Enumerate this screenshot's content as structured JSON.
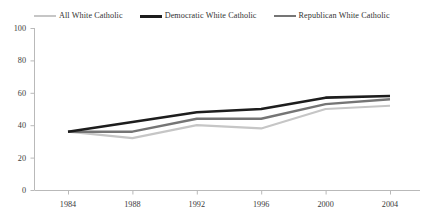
{
  "chart_data": {
    "type": "line",
    "title": "",
    "subtitle": "",
    "xlabel": "",
    "ylabel": "",
    "categories": [
      "1984",
      "1988",
      "1992",
      "1996",
      "2000",
      "2004"
    ],
    "x": [
      1984,
      1988,
      1992,
      1996,
      2000,
      2004
    ],
    "ylim": [
      0,
      100
    ],
    "xlim": [
      1984,
      2004
    ],
    "yticks": [
      "0",
      "20",
      "40",
      "60",
      "80",
      "100"
    ],
    "ytick_values": [
      0,
      20,
      40,
      60,
      80,
      100
    ],
    "grid": false,
    "legend_position": "top",
    "series": [
      {
        "name": "All White Catholic",
        "color": "#c6c6c6",
        "width": 2.2,
        "values": [
          36,
          32,
          40,
          38,
          50,
          52
        ]
      },
      {
        "name": "Democratic White Catholic",
        "color": "#1d1d1d",
        "width": 2.6,
        "values": [
          36,
          42,
          48,
          50,
          57,
          58
        ]
      },
      {
        "name": "Republican White Catholic",
        "color": "#757575",
        "width": 2.4,
        "values": [
          36,
          36,
          44,
          44,
          53,
          56
        ]
      }
    ]
  },
  "legend": {
    "items": [
      {
        "label": "All White Catholic",
        "color": "#c6c6c6",
        "thickness": 2
      },
      {
        "label": "Democratic White Catholic",
        "color": "#1d1d1d",
        "thickness": 3
      },
      {
        "label": "Republican White Catholic",
        "color": "#757575",
        "thickness": 2.5
      }
    ]
  },
  "axes": {
    "axis_color": "#b9b9b9",
    "baseline_color": "#b9b9b9",
    "tick_color": "#b9b9b9"
  },
  "footnote": {
    "text": ""
  }
}
